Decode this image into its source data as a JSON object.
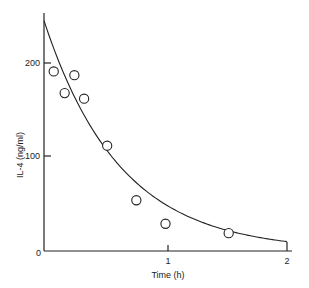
{
  "chart_data": {
    "type": "scatter",
    "title": "",
    "xlabel": "Time (h)",
    "ylabel": "IL-4 (ng/ml)",
    "xlim": [
      0,
      2
    ],
    "ylim": [
      0,
      260
    ],
    "x_ticks": [
      0,
      1,
      2
    ],
    "y_ticks": [
      0,
      100,
      200
    ],
    "x_tick_labels": [
      "0",
      "1",
      "2"
    ],
    "y_tick_labels": [
      "0",
      "100",
      "200"
    ],
    "grid": false,
    "legend": null,
    "series": [
      {
        "name": "Observed IL-4",
        "marker": "open-circle",
        "points": [
          {
            "x": 0.08,
            "y": 191
          },
          {
            "x": 0.17,
            "y": 168
          },
          {
            "x": 0.25,
            "y": 187
          },
          {
            "x": 0.33,
            "y": 162
          },
          {
            "x": 0.52,
            "y": 112
          },
          {
            "x": 0.76,
            "y": 54
          },
          {
            "x": 1.0,
            "y": 29
          },
          {
            "x": 1.52,
            "y": 19
          }
        ]
      },
      {
        "name": "Fitted exponential decay",
        "type": "line",
        "model": "y = 245 * exp(-1.6 * x)",
        "y0": 245,
        "k": 1.6
      }
    ]
  },
  "labels": {
    "xlabel": "Time (h)",
    "ylabel": "IL-4 (ng/ml)",
    "x0": "0",
    "x1": "1",
    "x2": "2",
    "y100": "100",
    "y200": "200"
  }
}
